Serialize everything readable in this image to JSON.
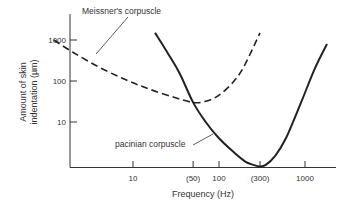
{
  "chart_data": {
    "type": "line",
    "title": "",
    "xlabel": "Frequency (Hz)",
    "ylabel": [
      "Amount of skin",
      "indentation (µm)"
    ],
    "xscale": "log",
    "yscale": "log",
    "xlim": [
      1,
      3000
    ],
    "ylim": [
      0.8,
      3000
    ],
    "grid": false,
    "x_ticks": [
      {
        "value": 10,
        "label": "10"
      },
      {
        "value": 50,
        "label": "(50)"
      },
      {
        "value": 100,
        "label": "100"
      },
      {
        "value": 300,
        "label": "(300)"
      },
      {
        "value": 1000,
        "label": "1000"
      }
    ],
    "y_ticks": [
      {
        "value": 10,
        "label": "10"
      },
      {
        "value": 100,
        "label": "100"
      },
      {
        "value": 1000,
        "label": "1000"
      }
    ],
    "series": [
      {
        "name": "Meissner's corpuscle",
        "style": "dashed",
        "color": "#222222",
        "x": [
          1.2,
          2,
          4,
          8,
          15,
          30,
          50,
          70,
          100,
          150,
          200,
          300
        ],
        "y": [
          1000,
          500,
          220,
          110,
          65,
          40,
          30,
          32,
          45,
          100,
          250,
          1500
        ]
      },
      {
        "name": "pacinian corpuscle",
        "style": "solid",
        "color": "#222222",
        "x": [
          18,
          25,
          35,
          50,
          70,
          100,
          150,
          200,
          250,
          300,
          350,
          450,
          600,
          900,
          1300,
          1800
        ],
        "y": [
          1500,
          500,
          150,
          30,
          10,
          4,
          1.8,
          1.1,
          0.9,
          0.82,
          0.9,
          1.5,
          4,
          30,
          200,
          800
        ]
      }
    ],
    "annotations": [
      {
        "text": "Meissner's corpuscle",
        "points_to": "Meissner's corpuscle"
      },
      {
        "text": "pacinian corpuscle",
        "points_to": "pacinian corpuscle"
      }
    ]
  }
}
